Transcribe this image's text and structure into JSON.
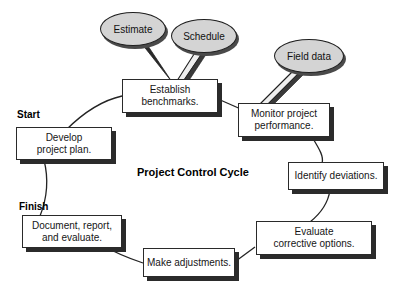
{
  "diagram": {
    "title": "Project Control Cycle",
    "start_label": "Start",
    "finish_label": "Finish",
    "colors": {
      "bubble_fill": "#d4d4d4",
      "box_fill": "#ffffff",
      "stroke": "#1f1f1f",
      "shadow": "#2b2b2b"
    },
    "nodes": [
      {
        "id": "establish-benchmarks",
        "line1": "Establish",
        "line2": "benchmarks."
      },
      {
        "id": "monitor-project-performance",
        "line1": "Monitor project",
        "line2": "performance."
      },
      {
        "id": "identify-deviations",
        "line1": "Identify deviations.",
        "line2": ""
      },
      {
        "id": "evaluate-corrective-options",
        "line1": "Evaluate",
        "line2": "corrective options."
      },
      {
        "id": "make-adjustments",
        "line1": "Make adjustments.",
        "line2": ""
      },
      {
        "id": "document-report-evaluate",
        "line1": "Document, report,",
        "line2": "and evaluate."
      },
      {
        "id": "develop-project-plan",
        "line1": "Develop",
        "line2": "project plan."
      }
    ],
    "bubbles": [
      {
        "id": "estimate",
        "label": "Estimate"
      },
      {
        "id": "schedule",
        "label": "Schedule"
      },
      {
        "id": "field-data",
        "label": "Field data"
      }
    ]
  }
}
